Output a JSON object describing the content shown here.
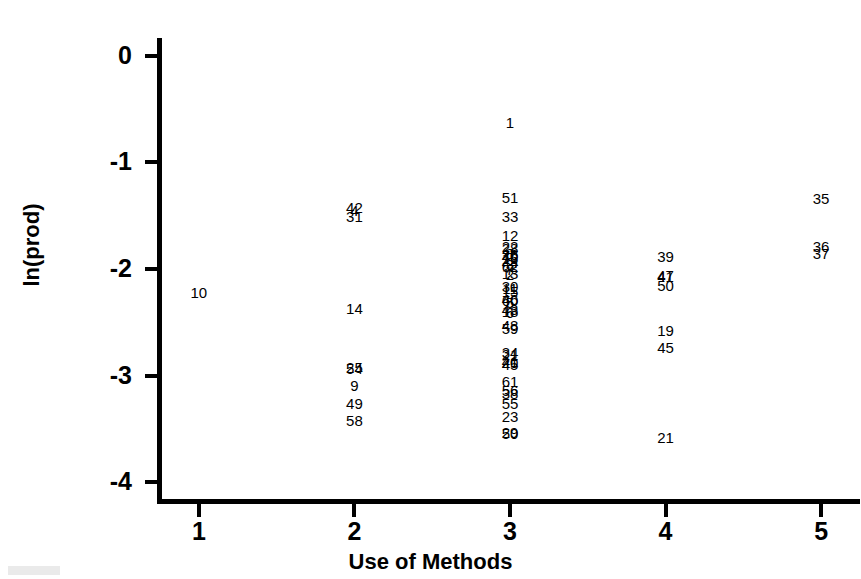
{
  "chart_data": {
    "type": "scatter",
    "title": "",
    "xlabel": "Use of Methods",
    "ylabel": "ln(prod)",
    "xlim": [
      0.75,
      5.25
    ],
    "ylim": [
      -4.15,
      0.15
    ],
    "xticks": [
      "1",
      "2",
      "3",
      "4",
      "5"
    ],
    "yticks": [
      "0",
      "-1",
      "-2",
      "-3",
      "-4"
    ],
    "grid": false,
    "legend": "none",
    "marker_style": "case-number-label",
    "note": "Each plotted point is rendered as its case number instead of a marker symbol.",
    "points": [
      {
        "label": "10",
        "x": 1,
        "y": -2.22
      },
      {
        "label": "42",
        "x": 2,
        "y": -1.42
      },
      {
        "label": "4",
        "x": 2,
        "y": -1.45
      },
      {
        "label": "31",
        "x": 2,
        "y": -1.5
      },
      {
        "label": "14",
        "x": 2,
        "y": -2.37
      },
      {
        "label": "25",
        "x": 2,
        "y": -2.92
      },
      {
        "label": "54",
        "x": 2,
        "y": -2.93
      },
      {
        "label": "9",
        "x": 2,
        "y": -3.09
      },
      {
        "label": "49",
        "x": 2,
        "y": -3.26
      },
      {
        "label": "58",
        "x": 2,
        "y": -3.42
      },
      {
        "label": "1",
        "x": 3,
        "y": -0.62
      },
      {
        "label": "51",
        "x": 3,
        "y": -1.32
      },
      {
        "label": "33",
        "x": 3,
        "y": -1.5
      },
      {
        "label": "12",
        "x": 3,
        "y": -1.68
      },
      {
        "label": "22",
        "x": 3,
        "y": -1.78
      },
      {
        "label": "28",
        "x": 3,
        "y": -1.8
      },
      {
        "label": "8",
        "x": 3,
        "y": -1.85
      },
      {
        "label": "26",
        "x": 3,
        "y": -1.86
      },
      {
        "label": "40",
        "x": 3,
        "y": -1.88
      },
      {
        "label": "16",
        "x": 3,
        "y": -1.9
      },
      {
        "label": "44",
        "x": 3,
        "y": -1.93
      },
      {
        "label": "3",
        "x": 3,
        "y": -1.95
      },
      {
        "label": "62",
        "x": 3,
        "y": -1.97
      },
      {
        "label": "7",
        "x": 3,
        "y": -2.0
      },
      {
        "label": "13",
        "x": 3,
        "y": -2.04
      },
      {
        "label": "2",
        "x": 3,
        "y": -2.05
      },
      {
        "label": "30",
        "x": 3,
        "y": -2.16
      },
      {
        "label": "11",
        "x": 3,
        "y": -2.18
      },
      {
        "label": "15",
        "x": 3,
        "y": -2.21
      },
      {
        "label": "46",
        "x": 3,
        "y": -2.28
      },
      {
        "label": "60",
        "x": 3,
        "y": -2.29
      },
      {
        "label": "5",
        "x": 3,
        "y": -2.31
      },
      {
        "label": "43",
        "x": 3,
        "y": -2.38
      },
      {
        "label": "18",
        "x": 3,
        "y": -2.39
      },
      {
        "label": "6",
        "x": 3,
        "y": -2.4
      },
      {
        "label": "48",
        "x": 3,
        "y": -2.53
      },
      {
        "label": "59",
        "x": 3,
        "y": -2.55
      },
      {
        "label": "34",
        "x": 3,
        "y": -2.78
      },
      {
        "label": "21",
        "x": 3,
        "y": -2.8
      },
      {
        "label": "41",
        "x": 3,
        "y": -2.86
      },
      {
        "label": "20",
        "x": 3,
        "y": -2.87
      },
      {
        "label": "45",
        "x": 3,
        "y": -2.89
      },
      {
        "label": "61",
        "x": 3,
        "y": -3.05
      },
      {
        "label": "56",
        "x": 3,
        "y": -3.14
      },
      {
        "label": "38",
        "x": 3,
        "y": -3.16
      },
      {
        "label": "55",
        "x": 3,
        "y": -3.26
      },
      {
        "label": "23",
        "x": 3,
        "y": -3.38
      },
      {
        "label": "29",
        "x": 3,
        "y": -3.53
      },
      {
        "label": "50",
        "x": 3,
        "y": -3.54
      },
      {
        "label": "39",
        "x": 4,
        "y": -1.88
      },
      {
        "label": "47",
        "x": 4,
        "y": -2.06
      },
      {
        "label": "41",
        "x": 4,
        "y": -2.07
      },
      {
        "label": "50",
        "x": 4,
        "y": -2.15
      },
      {
        "label": "19",
        "x": 4,
        "y": -2.57
      },
      {
        "label": "45",
        "x": 4,
        "y": -2.73
      },
      {
        "label": "21",
        "x": 4,
        "y": -3.58
      },
      {
        "label": "35",
        "x": 5,
        "y": -1.33
      },
      {
        "label": "36",
        "x": 5,
        "y": -1.78
      },
      {
        "label": "37",
        "x": 5,
        "y": -1.85
      }
    ]
  }
}
